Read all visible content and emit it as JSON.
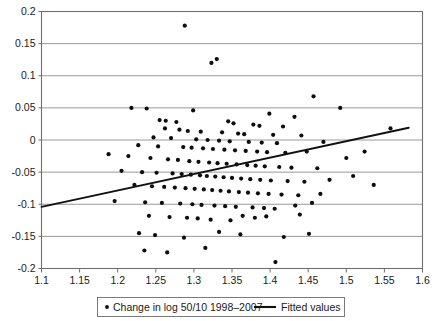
{
  "chart_data": {
    "type": "scatter",
    "title": "",
    "xlabel": "",
    "ylabel": "",
    "xlim": [
      1.1,
      1.6
    ],
    "ylim": [
      -0.2,
      0.2
    ],
    "xticks": [
      "1.1",
      "1.15",
      "1.2",
      "1.25",
      "1.3",
      "1.35",
      "1.4",
      "1.45",
      "1.5",
      "1.55",
      "1.6"
    ],
    "xtick_values": [
      1.1,
      1.15,
      1.2,
      1.25,
      1.3,
      1.35,
      1.4,
      1.45,
      1.5,
      1.55,
      1.6
    ],
    "yticks": [
      "0.2",
      "0.15",
      "0.1",
      "0.05",
      "0",
      "-0.05",
      "-0.1",
      "-0.15",
      "-0.2"
    ],
    "ytick_values": [
      0.2,
      0.15,
      0.1,
      0.05,
      0,
      -0.05,
      -0.1,
      -0.15,
      -0.2
    ],
    "grid": "horizontal",
    "legend_position": "bottom",
    "legend": [
      {
        "label": "Change in log 50/10 1998–2007",
        "marker": "dot",
        "color": "#0d0d0d"
      },
      {
        "label": "Fitted values",
        "marker": "line",
        "color": "#111111"
      }
    ],
    "series": [
      {
        "name": "Change in log 50/10 1998–2007",
        "type": "scatter",
        "marker": "dot",
        "color": "#0d0d0d",
        "points": [
          [
            1.288,
            0.178
          ],
          [
            1.323,
            0.12
          ],
          [
            1.33,
            0.126
          ],
          [
            1.457,
            0.068
          ],
          [
            1.492,
            0.05
          ],
          [
            1.218,
            0.05
          ],
          [
            1.238,
            0.049
          ],
          [
            1.299,
            0.046
          ],
          [
            1.399,
            0.041
          ],
          [
            1.432,
            0.036
          ],
          [
            1.255,
            0.031
          ],
          [
            1.263,
            0.03
          ],
          [
            1.277,
            0.028
          ],
          [
            1.345,
            0.029
          ],
          [
            1.352,
            0.026
          ],
          [
            1.378,
            0.024
          ],
          [
            1.386,
            0.022
          ],
          [
            1.417,
            0.021
          ],
          [
            1.262,
            0.018
          ],
          [
            1.281,
            0.016
          ],
          [
            1.292,
            0.014
          ],
          [
            1.309,
            0.013
          ],
          [
            1.337,
            0.012
          ],
          [
            1.358,
            0.01
          ],
          [
            1.366,
            0.009
          ],
          [
            1.404,
            0.008
          ],
          [
            1.441,
            0.007
          ],
          [
            1.247,
            0.004
          ],
          [
            1.27,
            0.003
          ],
          [
            1.303,
            0.001
          ],
          [
            1.318,
            0.0
          ],
          [
            1.333,
            -0.001
          ],
          [
            1.347,
            -0.002
          ],
          [
            1.372,
            -0.003
          ],
          [
            1.389,
            -0.004
          ],
          [
            1.409,
            -0.005
          ],
          [
            1.47,
            -0.003
          ],
          [
            1.227,
            -0.008
          ],
          [
            1.253,
            -0.01
          ],
          [
            1.286,
            -0.011
          ],
          [
            1.297,
            -0.012
          ],
          [
            1.312,
            -0.013
          ],
          [
            1.325,
            -0.014
          ],
          [
            1.34,
            -0.015
          ],
          [
            1.354,
            -0.016
          ],
          [
            1.368,
            -0.017
          ],
          [
            1.383,
            -0.018
          ],
          [
            1.396,
            -0.019
          ],
          [
            1.42,
            -0.02
          ],
          [
            1.448,
            -0.018
          ],
          [
            1.188,
            -0.022
          ],
          [
            1.214,
            -0.025
          ],
          [
            1.243,
            -0.028
          ],
          [
            1.266,
            -0.03
          ],
          [
            1.279,
            -0.031
          ],
          [
            1.294,
            -0.033
          ],
          [
            1.306,
            -0.034
          ],
          [
            1.32,
            -0.035
          ],
          [
            1.331,
            -0.036
          ],
          [
            1.343,
            -0.037
          ],
          [
            1.356,
            -0.038
          ],
          [
            1.37,
            -0.039
          ],
          [
            1.381,
            -0.04
          ],
          [
            1.393,
            -0.041
          ],
          [
            1.412,
            -0.042
          ],
          [
            1.428,
            -0.043
          ],
          [
            1.462,
            -0.044
          ],
          [
            1.5,
            -0.028
          ],
          [
            1.524,
            -0.018
          ],
          [
            1.558,
            0.018
          ],
          [
            1.205,
            -0.048
          ],
          [
            1.232,
            -0.05
          ],
          [
            1.251,
            -0.051
          ],
          [
            1.272,
            -0.052
          ],
          [
            1.284,
            -0.053
          ],
          [
            1.296,
            -0.054
          ],
          [
            1.308,
            -0.055
          ],
          [
            1.317,
            -0.056
          ],
          [
            1.328,
            -0.057
          ],
          [
            1.339,
            -0.058
          ],
          [
            1.35,
            -0.059
          ],
          [
            1.362,
            -0.06
          ],
          [
            1.374,
            -0.061
          ],
          [
            1.387,
            -0.062
          ],
          [
            1.401,
            -0.063
          ],
          [
            1.423,
            -0.064
          ],
          [
            1.445,
            -0.065
          ],
          [
            1.478,
            -0.062
          ],
          [
            1.509,
            -0.056
          ],
          [
            1.222,
            -0.07
          ],
          [
            1.245,
            -0.072
          ],
          [
            1.261,
            -0.073
          ],
          [
            1.275,
            -0.074
          ],
          [
            1.289,
            -0.075
          ],
          [
            1.301,
            -0.076
          ],
          [
            1.313,
            -0.077
          ],
          [
            1.324,
            -0.078
          ],
          [
            1.335,
            -0.079
          ],
          [
            1.346,
            -0.08
          ],
          [
            1.359,
            -0.081
          ],
          [
            1.371,
            -0.082
          ],
          [
            1.384,
            -0.083
          ],
          [
            1.398,
            -0.084
          ],
          [
            1.415,
            -0.085
          ],
          [
            1.437,
            -0.086
          ],
          [
            1.466,
            -0.084
          ],
          [
            1.536,
            -0.07
          ],
          [
            1.196,
            -0.095
          ],
          [
            1.236,
            -0.097
          ],
          [
            1.258,
            -0.098
          ],
          [
            1.282,
            -0.099
          ],
          [
            1.298,
            -0.1
          ],
          [
            1.31,
            -0.101
          ],
          [
            1.327,
            -0.102
          ],
          [
            1.341,
            -0.103
          ],
          [
            1.355,
            -0.104
          ],
          [
            1.377,
            -0.105
          ],
          [
            1.392,
            -0.106
          ],
          [
            1.406,
            -0.107
          ],
          [
            1.433,
            -0.102
          ],
          [
            1.455,
            -0.098
          ],
          [
            1.241,
            -0.118
          ],
          [
            1.268,
            -0.12
          ],
          [
            1.291,
            -0.121
          ],
          [
            1.305,
            -0.122
          ],
          [
            1.322,
            -0.124
          ],
          [
            1.348,
            -0.125
          ],
          [
            1.364,
            -0.118
          ],
          [
            1.38,
            -0.121
          ],
          [
            1.395,
            -0.119
          ],
          [
            1.439,
            -0.116
          ],
          [
            1.228,
            -0.145
          ],
          [
            1.249,
            -0.148
          ],
          [
            1.287,
            -0.152
          ],
          [
            1.333,
            -0.143
          ],
          [
            1.361,
            -0.147
          ],
          [
            1.418,
            -0.151
          ],
          [
            1.451,
            -0.146
          ],
          [
            1.235,
            -0.172
          ],
          [
            1.265,
            -0.175
          ],
          [
            1.315,
            -0.168
          ],
          [
            1.407,
            -0.19
          ]
        ]
      },
      {
        "name": "Fitted values",
        "type": "line",
        "color": "#111111",
        "endpoints": [
          [
            1.1,
            -0.104
          ],
          [
            1.582,
            0.019
          ]
        ],
        "slope": 0.255,
        "intercept": -0.385
      }
    ]
  }
}
